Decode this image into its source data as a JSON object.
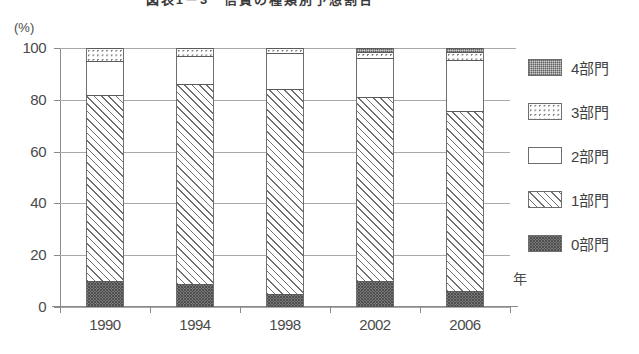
{
  "chart_data": {
    "type": "bar",
    "subtype": "stacked-column-100",
    "title": "図表1－3　信貸の種類別予想割合",
    "xlabel": "年",
    "ylabel": "(%)",
    "ylim": [
      0,
      100
    ],
    "yticks": [
      0,
      20,
      40,
      60,
      80,
      100
    ],
    "grid": true,
    "legend_position": "right",
    "categories": [
      "1990",
      "1994",
      "1998",
      "2002",
      "2006"
    ],
    "series": [
      {
        "name": "0部門",
        "pattern": "dense-dark-dots",
        "values": [
          10,
          9,
          5,
          10,
          6
        ]
      },
      {
        "name": "1部門",
        "pattern": "diagonal-hatch",
        "values": [
          72,
          77,
          79,
          71,
          69.5
        ]
      },
      {
        "name": "2部門",
        "pattern": "white",
        "values": [
          13,
          11,
          14,
          15,
          20
        ]
      },
      {
        "name": "3部門",
        "pattern": "sparse-dots",
        "values": [
          5,
          3,
          2,
          2.5,
          3
        ]
      },
      {
        "name": "4部門",
        "pattern": "fine-stipple",
        "values": [
          0,
          0,
          0,
          1.5,
          1.5
        ]
      }
    ]
  },
  "axis": {
    "y_unit": "(%)",
    "x_unit": "年",
    "y_tick_labels": [
      "100",
      "80",
      "60",
      "40",
      "20",
      "0"
    ],
    "x_tick_labels": [
      "1990",
      "1994",
      "1998",
      "2002",
      "2006"
    ]
  },
  "legend": {
    "items": [
      {
        "label": "4部門",
        "pattern": "fine-stipple"
      },
      {
        "label": "3部門",
        "pattern": "sparse-dots"
      },
      {
        "label": "2部門",
        "pattern": "white"
      },
      {
        "label": "1部門",
        "pattern": "diagonal-hatch"
      },
      {
        "label": "0部門",
        "pattern": "dense-dark-dots"
      }
    ]
  },
  "colors": {
    "axis": "#8a8a8a",
    "grid": "#a9a9a9",
    "text": "#444444",
    "segment_border": "#6e6e6e"
  }
}
